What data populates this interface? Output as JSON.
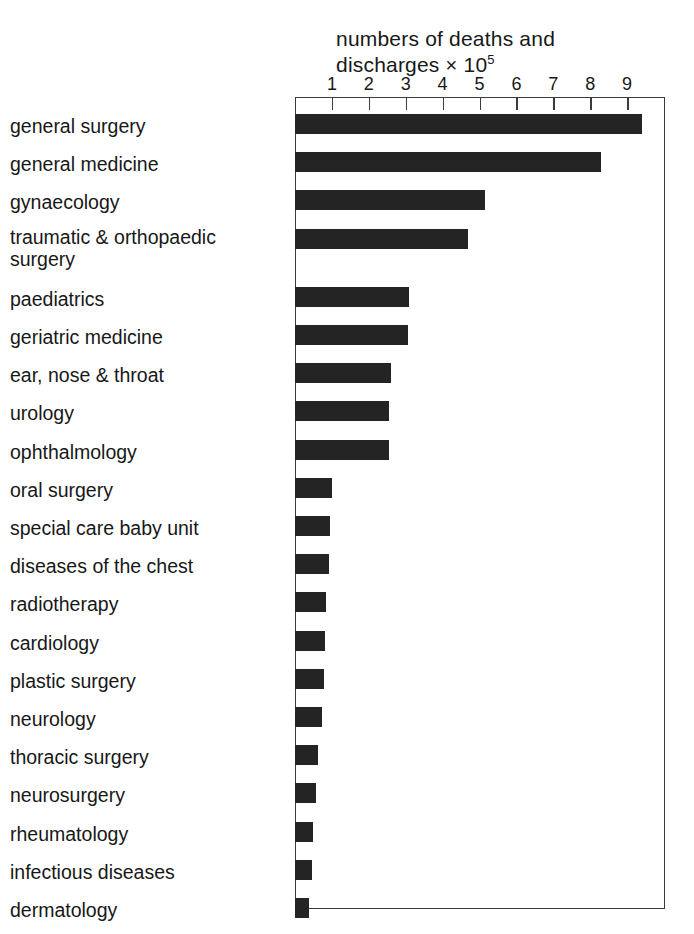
{
  "chart_data": {
    "type": "bar",
    "orientation": "horizontal",
    "title": "",
    "xlabel": "numbers of deaths and discharges × 10⁵",
    "ylabel": "",
    "xlim": [
      0,
      10
    ],
    "grid": false,
    "legend": null,
    "xticks": [
      1,
      2,
      3,
      4,
      5,
      6,
      7,
      8,
      9
    ],
    "categories": [
      "general surgery",
      "general medicine",
      "gynaecology",
      "traumatic & orthopaedic surgery",
      "paediatrics",
      "geriatric medicine",
      "ear, nose & throat",
      "urology",
      "ophthalmology",
      "oral surgery",
      "special care baby unit",
      "diseases of the chest",
      "radiotherapy",
      "cardiology",
      "plastic surgery",
      "neurology",
      "thoracic surgery",
      "neurosurgery",
      "rheumatology",
      "infectious diseases",
      "dermatology"
    ],
    "values": [
      9.4,
      8.3,
      5.15,
      4.7,
      3.1,
      3.05,
      2.6,
      2.55,
      2.55,
      1.0,
      0.95,
      0.92,
      0.85,
      0.8,
      0.78,
      0.72,
      0.62,
      0.58,
      0.5,
      0.45,
      0.38
    ]
  },
  "axis_title": {
    "line1": "numbers  of deaths and",
    "line2_pre": "discharges ",
    "line2_times": "×",
    "line2_base": " 10",
    "line2_exp": "5"
  },
  "colors": {
    "bar": "#242424",
    "frame": "#3b3b3b",
    "text": "#181818",
    "background": "#ffffff"
  }
}
